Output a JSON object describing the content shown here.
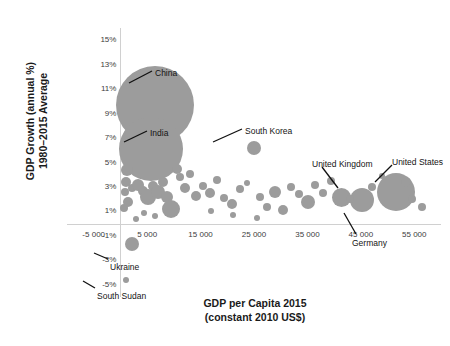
{
  "chart_data": {
    "type": "scatter",
    "title": "",
    "xlabel": "GDP per Capita 2015\n(constant 2010 US$)",
    "ylabel": "GDP Growth (annual %)\n1980–2015 Average",
    "xlim": [
      -10000,
      60000
    ],
    "ylim": [
      -6,
      16
    ],
    "grid": false,
    "legend": false,
    "bubble_color": "#9c9c9c",
    "xticks": [
      "-5 000",
      "5 000",
      "15 000",
      "25 000",
      "35 000",
      "45 000",
      "55 000"
    ],
    "xtick_values": [
      -5000,
      5000,
      15000,
      25000,
      35000,
      45000,
      55000
    ],
    "yticks": [
      "15%",
      "13%",
      "11%",
      "9%",
      "7%",
      "5%",
      "3%",
      "1%",
      "-1%",
      "-3%",
      "-5%"
    ],
    "ytick_values": [
      15,
      13,
      11,
      9,
      7,
      5,
      3,
      1,
      -1,
      -3,
      -5
    ],
    "size_encoding": "population",
    "points": [
      {
        "label": "China",
        "x": 6497,
        "y": 9.7,
        "r": 39
      },
      {
        "label": "India",
        "x": 5750,
        "y": 6.1,
        "r": 32
      },
      {
        "label": "South Korea",
        "x": 25023,
        "y": 6.2,
        "r": 7
      },
      {
        "label": "United Kingdom",
        "x": 41372,
        "y": 2.1,
        "r": 9.5
      },
      {
        "label": "Germany",
        "x": 45200,
        "y": 1.9,
        "r": 12
      },
      {
        "label": "United States",
        "x": 51638,
        "y": 2.6,
        "r": 19
      },
      {
        "label": "Ukraine",
        "x": 2125,
        "y": -1.7,
        "r": 7
      },
      {
        "label": "South Sudan",
        "x": 1000,
        "y": -4.6,
        "r": 3
      },
      {
        "label": "",
        "x": 1200,
        "y": 4.4,
        "r": 6
      },
      {
        "label": "",
        "x": 1100,
        "y": 3.4,
        "r": 5
      },
      {
        "label": "",
        "x": 800,
        "y": 2.6,
        "r": 4
      },
      {
        "label": "",
        "x": 1500,
        "y": 1.8,
        "r": 5
      },
      {
        "label": "",
        "x": 600,
        "y": 1.3,
        "r": 4
      },
      {
        "label": "",
        "x": 2100,
        "y": 2.9,
        "r": 4
      },
      {
        "label": "",
        "x": 3300,
        "y": 3.2,
        "r": 6
      },
      {
        "label": "",
        "x": 4300,
        "y": 2.7,
        "r": 5
      },
      {
        "label": "",
        "x": 5200,
        "y": 2.2,
        "r": 8
      },
      {
        "label": "",
        "x": 6100,
        "y": 3.1,
        "r": 5
      },
      {
        "label": "",
        "x": 7100,
        "y": 2.6,
        "r": 7
      },
      {
        "label": "",
        "x": 7900,
        "y": 3.4,
        "r": 5
      },
      {
        "label": "",
        "x": 8700,
        "y": 2.2,
        "r": 6
      },
      {
        "label": "",
        "x": 9500,
        "y": 1.2,
        "r": 9
      },
      {
        "label": "",
        "x": 10500,
        "y": 4.5,
        "r": 5
      },
      {
        "label": "",
        "x": 11200,
        "y": 3.8,
        "r": 4
      },
      {
        "label": "",
        "x": 12100,
        "y": 2.9,
        "r": 5
      },
      {
        "label": "",
        "x": 13100,
        "y": 4.1,
        "r": 4
      },
      {
        "label": "",
        "x": 14200,
        "y": 2.3,
        "r": 5
      },
      {
        "label": "",
        "x": 15500,
        "y": 3.1,
        "r": 4
      },
      {
        "label": "",
        "x": 16800,
        "y": 2.5,
        "r": 5
      },
      {
        "label": "",
        "x": 18100,
        "y": 3.6,
        "r": 4
      },
      {
        "label": "",
        "x": 19400,
        "y": 2.1,
        "r": 4
      },
      {
        "label": "",
        "x": 20800,
        "y": 1.6,
        "r": 5
      },
      {
        "label": "",
        "x": 22300,
        "y": 2.8,
        "r": 4
      },
      {
        "label": "",
        "x": 23600,
        "y": 3.3,
        "r": 3
      },
      {
        "label": "",
        "x": 26100,
        "y": 2.2,
        "r": 4
      },
      {
        "label": "",
        "x": 27400,
        "y": 1.4,
        "r": 4
      },
      {
        "label": "",
        "x": 29000,
        "y": 2.6,
        "r": 6
      },
      {
        "label": "",
        "x": 30500,
        "y": 1.1,
        "r": 5
      },
      {
        "label": "",
        "x": 32000,
        "y": 3.0,
        "r": 4
      },
      {
        "label": "",
        "x": 33500,
        "y": 2.4,
        "r": 4
      },
      {
        "label": "",
        "x": 35200,
        "y": 1.8,
        "r": 7
      },
      {
        "label": "",
        "x": 36500,
        "y": 3.2,
        "r": 4
      },
      {
        "label": "",
        "x": 38000,
        "y": 2.5,
        "r": 4
      },
      {
        "label": "",
        "x": 39500,
        "y": 3.5,
        "r": 4
      },
      {
        "label": "",
        "x": 43000,
        "y": 2.0,
        "r": 4
      },
      {
        "label": "",
        "x": 47000,
        "y": 3.0,
        "r": 4
      },
      {
        "label": "",
        "x": 49000,
        "y": 3.9,
        "r": 3
      },
      {
        "label": "",
        "x": 53500,
        "y": 3.4,
        "r": 5
      },
      {
        "label": "",
        "x": 54500,
        "y": 2.0,
        "r": 4
      },
      {
        "label": "",
        "x": 56500,
        "y": 1.4,
        "r": 4
      },
      {
        "label": "",
        "x": 3000,
        "y": 0.4,
        "r": 3
      },
      {
        "label": "",
        "x": 4500,
        "y": 0.9,
        "r": 3
      },
      {
        "label": "",
        "x": 6500,
        "y": 0.6,
        "r": 3
      },
      {
        "label": "",
        "x": 17000,
        "y": 1.0,
        "r": 3
      },
      {
        "label": "",
        "x": 21000,
        "y": 0.7,
        "r": 3
      },
      {
        "label": "",
        "x": 25500,
        "y": 0.5,
        "r": 3
      }
    ],
    "annotations": [
      {
        "text": "China",
        "tx": 155,
        "ty": 68,
        "lx1": 129,
        "ly1": 83,
        "lx2": 152,
        "ly2": 71
      },
      {
        "text": "India",
        "tx": 150,
        "ty": 128,
        "lx1": 124,
        "ly1": 142,
        "lx2": 147,
        "ly2": 131
      },
      {
        "text": "South Korea",
        "tx": 245,
        "ty": 126,
        "lx1": 213,
        "ly1": 142,
        "lx2": 242,
        "ly2": 129
      },
      {
        "text": "United Kingdom",
        "tx": 312,
        "ty": 159,
        "lx1": 338,
        "ly1": 188,
        "lx2": 322,
        "ly2": 167
      },
      {
        "text": "United States",
        "tx": 392,
        "ty": 157,
        "lx1": 375,
        "ly1": 182,
        "lx2": 392,
        "ly2": 165
      },
      {
        "text": "Germany",
        "tx": 352,
        "ty": 238,
        "lx1": 344,
        "ly1": 213,
        "lx2": 356,
        "ly2": 234
      },
      {
        "text": "Ukraine",
        "tx": 110,
        "ty": 262,
        "lx1": 94,
        "ly1": 253,
        "lx2": 108,
        "ly2": 259
      },
      {
        "text": "South Sudan",
        "tx": 97,
        "ty": 291,
        "lx1": 83,
        "ly1": 281,
        "lx2": 95,
        "ly2": 288
      }
    ]
  }
}
